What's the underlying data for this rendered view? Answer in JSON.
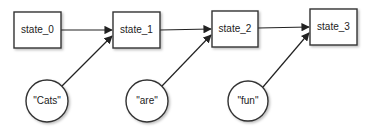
{
  "diagram": {
    "type": "rnn-state-chain",
    "states": [
      {
        "id": "state_0",
        "label": "state_0"
      },
      {
        "id": "state_1",
        "label": "state_1"
      },
      {
        "id": "state_2",
        "label": "state_2"
      },
      {
        "id": "state_3",
        "label": "state_3"
      }
    ],
    "inputs": [
      {
        "id": "input_0",
        "label": "\"Cats\"",
        "target": "state_1"
      },
      {
        "id": "input_1",
        "label": "\"are\"",
        "target": "state_2"
      },
      {
        "id": "input_2",
        "label": "\"fun\"",
        "target": "state_3"
      }
    ],
    "edges": [
      {
        "from": "state_0",
        "to": "state_1"
      },
      {
        "from": "state_1",
        "to": "state_2"
      },
      {
        "from": "state_2",
        "to": "state_3"
      },
      {
        "from": "input_0",
        "to": "state_1"
      },
      {
        "from": "input_1",
        "to": "state_2"
      },
      {
        "from": "input_2",
        "to": "state_3"
      }
    ],
    "colors": {
      "stroke": "#333333",
      "fill": "#ffffff",
      "text": "#222222"
    }
  }
}
